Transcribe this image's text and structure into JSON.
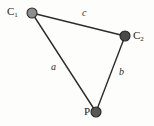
{
  "figure": {
    "type": "geometry-diagram",
    "width": 154,
    "height": 126,
    "background_color": "#fdfdfc"
  },
  "vertices": [
    {
      "id": "C1",
      "label_main": "C",
      "label_sub": "1",
      "x": 32,
      "y": 13,
      "radius": 5,
      "fill_color": "#8d8d8d",
      "stroke_color": "#2b2b2b"
    },
    {
      "id": "C2",
      "label_main": "C",
      "label_sub": "2",
      "x": 125,
      "y": 36,
      "radius": 5,
      "fill_color": "#4a4a4a",
      "stroke_color": "#222222"
    },
    {
      "id": "P",
      "label_main": "P",
      "label_sub": "",
      "x": 96,
      "y": 112,
      "radius": 5,
      "fill_color": "#575757",
      "stroke_color": "#222222"
    }
  ],
  "edges": [
    {
      "id": "edge-a",
      "label": "a",
      "from": "C1",
      "to": "P",
      "x1": 32,
      "y1": 13,
      "x2": 96,
      "y2": 112,
      "label_x": 54,
      "label_y": 68,
      "stroke_color": "#2c2c2c",
      "stroke_width": 1.4
    },
    {
      "id": "edge-b",
      "label": "b",
      "from": "C2",
      "to": "P",
      "x1": 125,
      "y1": 36,
      "x2": 96,
      "y2": 112,
      "label_x": 122,
      "label_y": 73,
      "stroke_color": "#2c2c2c",
      "stroke_width": 1.4
    },
    {
      "id": "edge-c",
      "label": "c",
      "from": "C1",
      "to": "C2",
      "x1": 32,
      "y1": 13,
      "x2": 125,
      "y2": 36,
      "label_x": 84,
      "label_y": 14,
      "stroke_color": "#2c2c2c",
      "stroke_width": 1.4
    }
  ]
}
